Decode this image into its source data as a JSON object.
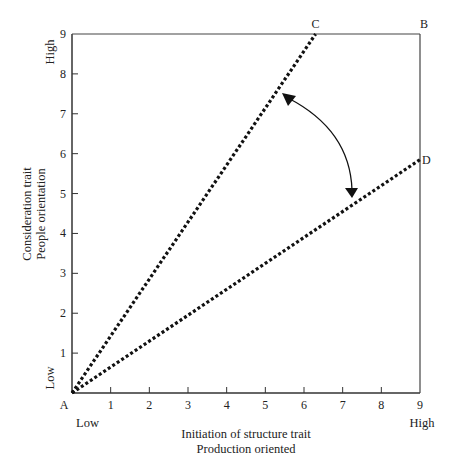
{
  "chart_data": {
    "type": "line",
    "title": "",
    "xlabel": "Initiation of structure trait",
    "xlabel_sub": "Production oriented",
    "ylabel": "Consideration trait",
    "ylabel_sub": "People orientation",
    "xlim": [
      0,
      9
    ],
    "ylim": [
      0,
      9
    ],
    "x_ticks": [
      "1",
      "2",
      "3",
      "4",
      "5",
      "6",
      "7",
      "8",
      "9"
    ],
    "y_ticks": [
      "1",
      "2",
      "3",
      "4",
      "5",
      "6",
      "7",
      "8",
      "9"
    ],
    "x_low_label": "Low",
    "x_high_label": "High",
    "y_low_label": "Low",
    "y_high_label": "High",
    "grid": false,
    "points": {
      "A": {
        "label": "A",
        "x": 0,
        "y": 0
      },
      "B": {
        "label": "B",
        "x": 9,
        "y": 9
      },
      "C": {
        "label": "C",
        "x": 6.3,
        "y": 9
      },
      "D": {
        "label": "D",
        "x": 9,
        "y": 5.85
      }
    },
    "series": [
      {
        "name": "Line AC",
        "style": "dotted",
        "x": [
          0,
          6.3
        ],
        "y": [
          0,
          9
        ]
      },
      {
        "name": "Line AD",
        "style": "dotted",
        "x": [
          0,
          9
        ],
        "y": [
          0,
          5.85
        ]
      }
    ],
    "annotations": [
      {
        "type": "double-headed-arc-arrow",
        "from_line": "AC",
        "to_line": "AD",
        "description": "Curved arrow indicating range between lines AC and AD"
      }
    ]
  }
}
